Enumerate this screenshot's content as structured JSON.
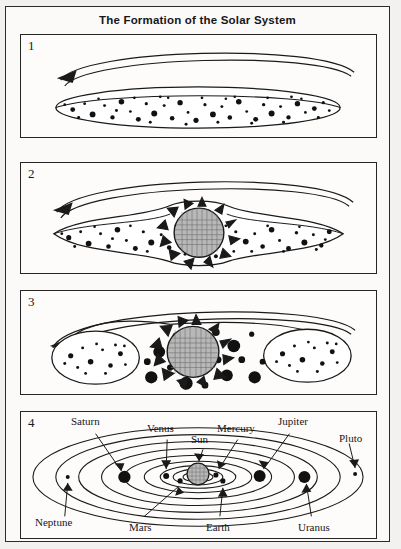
{
  "document": {
    "title": "The Formation of the Solar System",
    "style": "black-and-white scanned textbook line diagram",
    "background_color": "#f2f1ef",
    "ink_color": "#1a1a1a"
  },
  "panels": [
    {
      "number": "1",
      "caption_number": "1",
      "stage": "rotating flattened nebula disk of dust and gas",
      "rotation_arrow": {
        "icon": "curved-rotation-arrow-left",
        "direction": "left"
      },
      "shape": "lens-ellipse",
      "particles": "many small and medium dots filling the disk",
      "has_sun": false
    },
    {
      "number": "2",
      "caption_number": "2",
      "stage": "central bulge contracts, proto-sun ignites in the middle of the disk",
      "rotation_arrow": {
        "icon": "curved-rotation-arrow-left",
        "direction": "left"
      },
      "shape": "lens-ellipse-with-central-bulge",
      "particles": "dots distributed across both lobes",
      "has_sun": true,
      "sun": {
        "label": "proto-sun",
        "fill": "crosshatch-gray",
        "corona": "jagged flame spikes"
      }
    },
    {
      "number": "3",
      "caption_number": "3",
      "stage": "disk separates; planetesimals coalesce into larger bodies around the sun",
      "rotation_arrow": {
        "icon": "curved-rotation-arrow-left",
        "direction": "left"
      },
      "shape": "two-outer-blobs-with-central-region",
      "particles": "large black planetesimals near the sun, small dots in outer blobs",
      "has_sun": true,
      "sun": {
        "label": "sun",
        "fill": "crosshatch-gray",
        "corona": "triangular rays"
      }
    },
    {
      "number": "4",
      "caption_number": "4",
      "stage": "completed solar system with planets in concentric elliptical orbits",
      "has_sun": true,
      "sun": {
        "label": "Sun",
        "fill": "crosshatch-gray"
      }
    }
  ],
  "solar_system": {
    "center_body": "Sun",
    "orbit_count": 9,
    "labels": [
      {
        "name": "Saturn",
        "position": "top-left",
        "body_size": "large",
        "side": "left"
      },
      {
        "name": "Venus",
        "position": "top-center-left",
        "body_size": "small",
        "side": "left"
      },
      {
        "name": "Sun",
        "position": "top-center",
        "body_size": "center",
        "side": "center"
      },
      {
        "name": "Mercury",
        "position": "top-center-right",
        "body_size": "small",
        "side": "right"
      },
      {
        "name": "Jupiter",
        "position": "top-right",
        "body_size": "large",
        "side": "right"
      },
      {
        "name": "Pluto",
        "position": "top-far-right",
        "body_size": "tiny",
        "side": "right"
      },
      {
        "name": "Neptune",
        "position": "bottom-left",
        "body_size": "tiny",
        "side": "left"
      },
      {
        "name": "Mars",
        "position": "bottom-center-left",
        "body_size": "small",
        "side": "left"
      },
      {
        "name": "Earth",
        "position": "bottom-center-right",
        "body_size": "small",
        "side": "right"
      },
      {
        "name": "Uranus",
        "position": "bottom-right",
        "body_size": "large",
        "side": "right"
      }
    ]
  }
}
